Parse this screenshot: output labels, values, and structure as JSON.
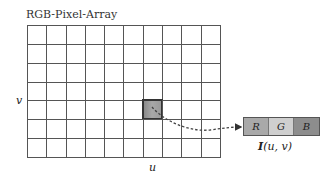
{
  "title": "RGB-Pixel-Array",
  "grid": {
    "columns": 10,
    "rows": 7,
    "highlighted_cell": {
      "col": 6,
      "row": 4
    }
  },
  "axes": {
    "horizontal": "u",
    "vertical": "v"
  },
  "pixel_components": [
    {
      "label": "R",
      "color": "#a9a9a9"
    },
    {
      "label": "G",
      "color": "#cfcfcf"
    },
    {
      "label": "B",
      "color": "#8d8d8d"
    }
  ],
  "pixel_label": {
    "symbol": "I",
    "args": "(u, v)"
  }
}
